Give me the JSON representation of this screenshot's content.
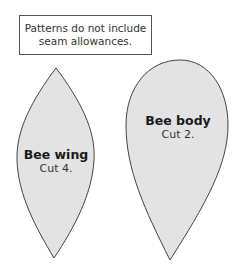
{
  "note": {
    "line1": "Patterns do not include",
    "line2": "seam allowances."
  },
  "pieces": [
    {
      "name": "Bee wing",
      "instruction": "Cut 4."
    },
    {
      "name": "Bee body",
      "instruction": "Cut 2."
    }
  ],
  "colors": {
    "fill": "#e3e3e3",
    "stroke": "#444444"
  }
}
